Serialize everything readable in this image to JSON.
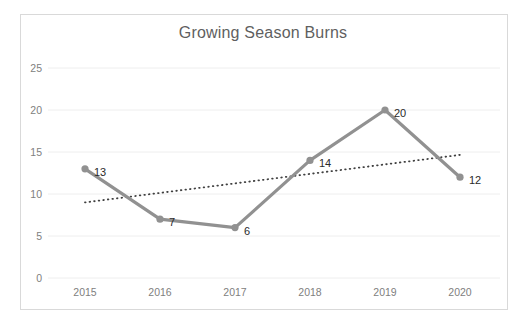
{
  "chart_data": {
    "type": "line",
    "title": "Growing Season Burns",
    "xlabel": "",
    "ylabel": "",
    "categories": [
      "2015",
      "2016",
      "2017",
      "2018",
      "2019",
      "2020"
    ],
    "values": [
      13,
      7,
      6,
      14,
      20,
      12
    ],
    "data_labels": [
      "13",
      "7",
      "6",
      "14",
      "20",
      "12"
    ],
    "series": [
      {
        "name": "Growing Season Burns",
        "values": [
          13,
          7,
          6,
          14,
          20,
          12
        ],
        "color": "#919191",
        "marker": "circle",
        "show_labels": true
      },
      {
        "name": "Linear trendline",
        "type": "trendline",
        "style": "dotted",
        "color": "#404040",
        "start_value": 9.0,
        "end_value": 14.7
      }
    ],
    "ylim": [
      0,
      25
    ],
    "y_ticks": [
      0,
      5,
      10,
      15,
      20,
      25
    ],
    "y_tick_labels": [
      "0",
      "5",
      "10",
      "15",
      "20",
      "25"
    ],
    "grid": "horizontal",
    "legend": "none",
    "plot_background": "#ffffff",
    "gridline_color": "#eeeeee",
    "border_color": "#d9d9d9",
    "title_color": "#5f5f5f",
    "tick_label_color": "#808080"
  }
}
